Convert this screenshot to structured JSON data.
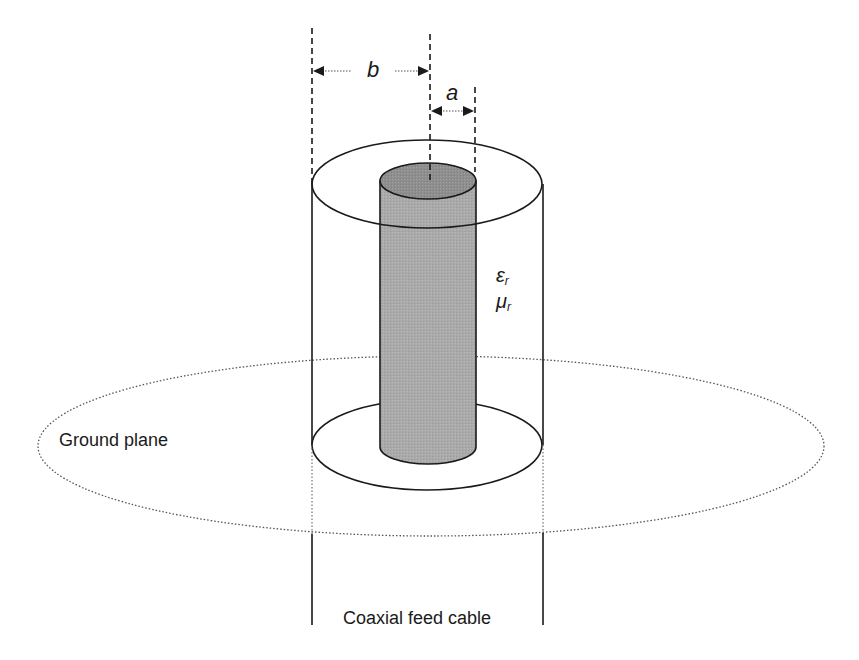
{
  "diagram": {
    "labels": {
      "outer_dimension": "b",
      "inner_dimension": "a",
      "permittivity_symbol": "ε",
      "permittivity_sub": "r",
      "permeability_symbol": "μ",
      "permeability_sub": "r",
      "ground_plane": "Ground plane",
      "feed": "Coaxial feed cable"
    },
    "colors": {
      "stroke": "#1a1a1a",
      "inner_conductor_side": "#a8a8a8",
      "inner_conductor_top": "#8e8e8e",
      "dotted": "#555555"
    }
  }
}
